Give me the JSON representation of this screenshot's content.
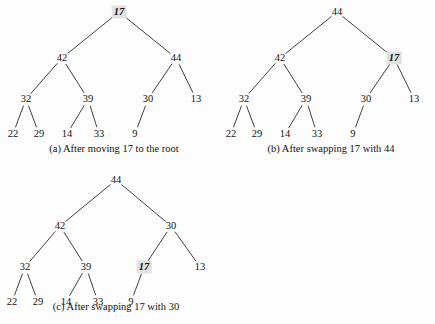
{
  "figure": {
    "background_color": "#fdfdfd",
    "node_color": "#141414",
    "edge_color": "#2b2b2b",
    "highlight_color": "#e2e2e2"
  },
  "panels": [
    {
      "id": "a",
      "caption": "(a) After moving 17 to the root",
      "caption_x": 114,
      "caption_y": 143,
      "origin_x": 0,
      "origin_y": 0,
      "width": 218,
      "height": 160,
      "nodes": [
        {
          "id": "n0",
          "label": "17",
          "x": 119,
          "y": 12,
          "highlight": true
        },
        {
          "id": "n1",
          "label": "42",
          "x": 62,
          "y": 58,
          "highlight": false
        },
        {
          "id": "n2",
          "label": "44",
          "x": 176,
          "y": 58,
          "highlight": false
        },
        {
          "id": "n3",
          "label": "32",
          "x": 26,
          "y": 99,
          "highlight": false
        },
        {
          "id": "n4",
          "label": "39",
          "x": 88,
          "y": 99,
          "highlight": false
        },
        {
          "id": "n5",
          "label": "30",
          "x": 148,
          "y": 99,
          "highlight": false
        },
        {
          "id": "n6",
          "label": "13",
          "x": 196,
          "y": 99,
          "highlight": false
        },
        {
          "id": "n7",
          "label": "22",
          "x": 13,
          "y": 134,
          "highlight": false
        },
        {
          "id": "n8",
          "label": "29",
          "x": 39,
          "y": 134,
          "highlight": false
        },
        {
          "id": "n9",
          "label": "14",
          "x": 67,
          "y": 134,
          "highlight": false
        },
        {
          "id": "n10",
          "label": "33",
          "x": 99,
          "y": 134,
          "highlight": false
        },
        {
          "id": "n11",
          "label": "9",
          "x": 135,
          "y": 134,
          "highlight": false
        }
      ],
      "edges": [
        {
          "from": "n0",
          "to": "n1"
        },
        {
          "from": "n0",
          "to": "n2"
        },
        {
          "from": "n1",
          "to": "n3"
        },
        {
          "from": "n1",
          "to": "n4"
        },
        {
          "from": "n2",
          "to": "n5"
        },
        {
          "from": "n2",
          "to": "n6"
        },
        {
          "from": "n3",
          "to": "n7"
        },
        {
          "from": "n3",
          "to": "n8"
        },
        {
          "from": "n4",
          "to": "n9"
        },
        {
          "from": "n4",
          "to": "n10"
        },
        {
          "from": "n5",
          "to": "n11"
        }
      ]
    },
    {
      "id": "b",
      "caption": "(b) After swapping 17 with 44",
      "caption_x": 331,
      "caption_y": 143,
      "origin_x": 218,
      "origin_y": 0,
      "width": 217,
      "height": 160,
      "nodes": [
        {
          "id": "n0",
          "label": "44",
          "x": 119,
          "y": 12,
          "highlight": false
        },
        {
          "id": "n1",
          "label": "42",
          "x": 62,
          "y": 58,
          "highlight": false
        },
        {
          "id": "n2",
          "label": "17",
          "x": 176,
          "y": 58,
          "highlight": true
        },
        {
          "id": "n3",
          "label": "32",
          "x": 26,
          "y": 99,
          "highlight": false
        },
        {
          "id": "n4",
          "label": "39",
          "x": 88,
          "y": 99,
          "highlight": false
        },
        {
          "id": "n5",
          "label": "30",
          "x": 148,
          "y": 99,
          "highlight": false
        },
        {
          "id": "n6",
          "label": "13",
          "x": 196,
          "y": 99,
          "highlight": false
        },
        {
          "id": "n7",
          "label": "22",
          "x": 13,
          "y": 134,
          "highlight": false
        },
        {
          "id": "n8",
          "label": "29",
          "x": 39,
          "y": 134,
          "highlight": false
        },
        {
          "id": "n9",
          "label": "14",
          "x": 67,
          "y": 134,
          "highlight": false
        },
        {
          "id": "n10",
          "label": "33",
          "x": 99,
          "y": 134,
          "highlight": false
        },
        {
          "id": "n11",
          "label": "9",
          "x": 135,
          "y": 134,
          "highlight": false
        }
      ],
      "edges": [
        {
          "from": "n0",
          "to": "n1"
        },
        {
          "from": "n0",
          "to": "n2"
        },
        {
          "from": "n1",
          "to": "n3"
        },
        {
          "from": "n1",
          "to": "n4"
        },
        {
          "from": "n2",
          "to": "n5"
        },
        {
          "from": "n2",
          "to": "n6"
        },
        {
          "from": "n3",
          "to": "n7"
        },
        {
          "from": "n3",
          "to": "n8"
        },
        {
          "from": "n4",
          "to": "n9"
        },
        {
          "from": "n4",
          "to": "n10"
        },
        {
          "from": "n5",
          "to": "n11"
        }
      ]
    },
    {
      "id": "c",
      "caption": "(c) After swapping 17 with 30",
      "caption_x": 116,
      "caption_y": 301,
      "origin_x": 0,
      "origin_y": 168,
      "width": 230,
      "height": 156,
      "nodes": [
        {
          "id": "n0",
          "label": "44",
          "x": 116,
          "y": 12,
          "highlight": false
        },
        {
          "id": "n1",
          "label": "42",
          "x": 60,
          "y": 58,
          "highlight": false
        },
        {
          "id": "n2",
          "label": "30",
          "x": 171,
          "y": 58,
          "highlight": false
        },
        {
          "id": "n3",
          "label": "32",
          "x": 25,
          "y": 99,
          "highlight": false
        },
        {
          "id": "n4",
          "label": "39",
          "x": 86,
          "y": 99,
          "highlight": false
        },
        {
          "id": "n5",
          "label": "17",
          "x": 144,
          "y": 99,
          "highlight": true
        },
        {
          "id": "n6",
          "label": "13",
          "x": 200,
          "y": 99,
          "highlight": false
        },
        {
          "id": "n7",
          "label": "22",
          "x": 12,
          "y": 134,
          "highlight": false
        },
        {
          "id": "n8",
          "label": "29",
          "x": 38,
          "y": 134,
          "highlight": false
        },
        {
          "id": "n9",
          "label": "14",
          "x": 66,
          "y": 134,
          "highlight": false
        },
        {
          "id": "n10",
          "label": "33",
          "x": 98,
          "y": 134,
          "highlight": false
        },
        {
          "id": "n11",
          "label": "9",
          "x": 131,
          "y": 134,
          "highlight": false
        }
      ],
      "edges": [
        {
          "from": "n0",
          "to": "n1"
        },
        {
          "from": "n0",
          "to": "n2"
        },
        {
          "from": "n1",
          "to": "n3"
        },
        {
          "from": "n1",
          "to": "n4"
        },
        {
          "from": "n2",
          "to": "n5"
        },
        {
          "from": "n2",
          "to": "n6"
        },
        {
          "from": "n3",
          "to": "n7"
        },
        {
          "from": "n3",
          "to": "n8"
        },
        {
          "from": "n4",
          "to": "n9"
        },
        {
          "from": "n4",
          "to": "n10"
        },
        {
          "from": "n5",
          "to": "n11"
        }
      ]
    }
  ]
}
